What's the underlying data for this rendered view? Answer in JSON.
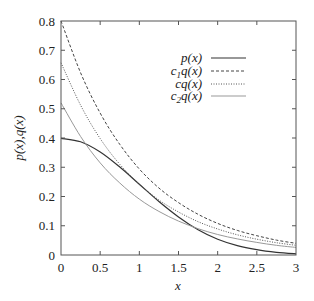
{
  "chart_data": {
    "type": "line",
    "title": "",
    "xlabel": "x",
    "ylabel": "p(x),q(x)",
    "xlim": [
      0,
      3
    ],
    "ylim": [
      0,
      0.8
    ],
    "xticks": [
      0,
      0.5,
      1,
      1.5,
      2,
      2.5,
      3
    ],
    "xtick_labels": [
      "0",
      "0.5",
      "1",
      "1.5",
      "2",
      "2.5",
      "3"
    ],
    "yticks": [
      0,
      0.1,
      0.2,
      0.3,
      0.4,
      0.5,
      0.6,
      0.7,
      0.8
    ],
    "ytick_labels": [
      "0",
      "0.1",
      "0.2",
      "0.3",
      "0.4",
      "0.5",
      "0.6",
      "0.7",
      "0.8"
    ],
    "grid": false,
    "legend_position": "upper right",
    "x": [
      0,
      0.25,
      0.5,
      0.75,
      1,
      1.25,
      1.5,
      1.75,
      2,
      2.25,
      2.5,
      2.75,
      3
    ],
    "series": [
      {
        "name": "p(x)",
        "legend_main": "p(x)",
        "legend_sub": "",
        "style": "solid",
        "color": "#333333",
        "values": [
          0.399,
          0.387,
          0.352,
          0.301,
          0.242,
          0.183,
          0.13,
          0.086,
          0.054,
          0.032,
          0.018,
          0.009,
          0.004
        ]
      },
      {
        "name": "c1q(x)",
        "legend_main": "c",
        "legend_sub": "1",
        "legend_tail": "q(x)",
        "style": "dashed",
        "color": "#444444",
        "values": [
          0.8,
          0.623,
          0.485,
          0.378,
          0.294,
          0.229,
          0.179,
          0.139,
          0.108,
          0.084,
          0.066,
          0.051,
          0.04
        ]
      },
      {
        "name": "cq(x)",
        "legend_main": "cq(x)",
        "legend_sub": "",
        "style": "dotted",
        "color": "#555555",
        "values": [
          0.657,
          0.512,
          0.398,
          0.31,
          0.242,
          0.188,
          0.147,
          0.114,
          0.089,
          0.069,
          0.054,
          0.042,
          0.033
        ]
      },
      {
        "name": "c2q(x)",
        "legend_main": "c",
        "legend_sub": "2",
        "legend_tail": "q(x)",
        "style": "solid-light",
        "color": "#999999",
        "values": [
          0.52,
          0.405,
          0.315,
          0.246,
          0.191,
          0.149,
          0.116,
          0.09,
          0.07,
          0.055,
          0.043,
          0.033,
          0.026
        ]
      }
    ]
  }
}
